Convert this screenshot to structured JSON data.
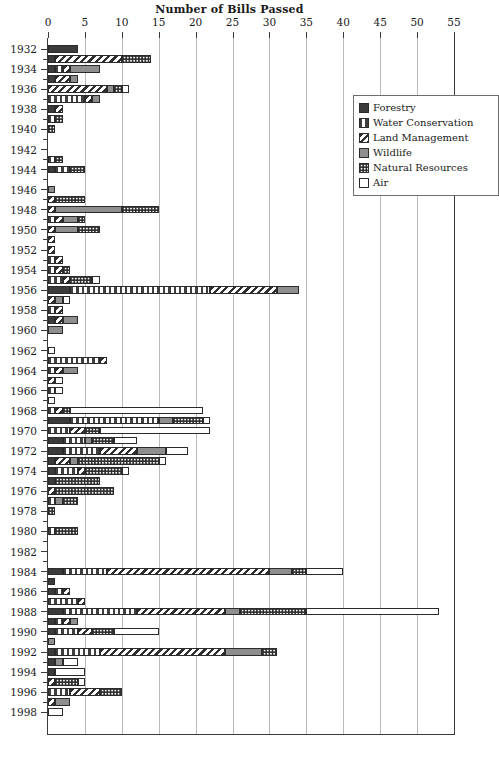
{
  "chart_data": {
    "type": "bar",
    "orientation": "horizontal",
    "stacked": true,
    "title": "Number of Bills Passed",
    "xlabel": "",
    "ylabel": "",
    "xlim": [
      0,
      55
    ],
    "xticks": [
      0,
      5,
      10,
      15,
      20,
      25,
      30,
      35,
      40,
      45,
      50,
      55
    ],
    "grid": "vertical",
    "legend_position": "top-right",
    "legend": [
      {
        "name": "Forestry",
        "pattern": "solid-dark",
        "color": "#3b3b3b"
      },
      {
        "name": "Water Conservation",
        "pattern": "vertical-stripes",
        "color": "#3f3f3f"
      },
      {
        "name": "Land Management",
        "pattern": "diagonal-stripes",
        "color": "#2f2f2f"
      },
      {
        "name": "Wildlife",
        "pattern": "solid-gray",
        "color": "#8e8e8e"
      },
      {
        "name": "Natural Resources",
        "pattern": "checkered",
        "color": "#2e2e2e"
      },
      {
        "name": "Air",
        "pattern": "empty-white",
        "color": "#ffffff"
      }
    ],
    "series": [
      "Forestry",
      "Water Conservation",
      "Land Management",
      "Wildlife",
      "Natural Resources",
      "Air"
    ],
    "ytick_labels": [
      1932,
      1934,
      1936,
      1938,
      1940,
      1942,
      1944,
      1946,
      1948,
      1950,
      1952,
      1954,
      1956,
      1958,
      1960,
      1962,
      1964,
      1966,
      1968,
      1970,
      1972,
      1974,
      1976,
      1978,
      1980,
      1982,
      1984,
      1986,
      1988,
      1990,
      1992,
      1994,
      1996,
      1998
    ],
    "rows": [
      {
        "year": 1932,
        "values": {
          "Forestry": 4,
          "Water Conservation": 0,
          "Land Management": 0,
          "Wildlife": 0,
          "Natural Resources": 0,
          "Air": 0
        },
        "total": 4
      },
      {
        "year": 1933,
        "values": {
          "Forestry": 1,
          "Water Conservation": 0,
          "Land Management": 9,
          "Wildlife": 0,
          "Natural Resources": 4,
          "Air": 0
        },
        "total": 14
      },
      {
        "year": 1934,
        "values": {
          "Forestry": 1,
          "Water Conservation": 1,
          "Land Management": 1,
          "Wildlife": 4,
          "Natural Resources": 0,
          "Air": 0
        },
        "total": 7
      },
      {
        "year": 1935,
        "values": {
          "Forestry": 1,
          "Water Conservation": 0,
          "Land Management": 2,
          "Wildlife": 1,
          "Natural Resources": 0,
          "Air": 0
        },
        "total": 4
      },
      {
        "year": 1936,
        "values": {
          "Forestry": 0,
          "Water Conservation": 0,
          "Land Management": 8,
          "Wildlife": 1,
          "Natural Resources": 1,
          "Air": 1
        },
        "total": 11
      },
      {
        "year": 1937,
        "values": {
          "Forestry": 0,
          "Water Conservation": 5,
          "Land Management": 1,
          "Wildlife": 1,
          "Natural Resources": 0,
          "Air": 0
        },
        "total": 7
      },
      {
        "year": 1938,
        "values": {
          "Forestry": 1,
          "Water Conservation": 0,
          "Land Management": 1,
          "Wildlife": 0,
          "Natural Resources": 0,
          "Air": 0
        },
        "total": 2
      },
      {
        "year": 1939,
        "values": {
          "Forestry": 0,
          "Water Conservation": 1,
          "Land Management": 0,
          "Wildlife": 0,
          "Natural Resources": 1,
          "Air": 0
        },
        "total": 2
      },
      {
        "year": 1940,
        "values": {
          "Forestry": 0,
          "Water Conservation": 0,
          "Land Management": 0,
          "Wildlife": 0,
          "Natural Resources": 1,
          "Air": 0
        },
        "total": 1
      },
      {
        "year": 1941,
        "values": {
          "Forestry": 0,
          "Water Conservation": 0,
          "Land Management": 0,
          "Wildlife": 0,
          "Natural Resources": 0,
          "Air": 0
        },
        "total": 0
      },
      {
        "year": 1942,
        "values": {
          "Forestry": 0,
          "Water Conservation": 0,
          "Land Management": 0,
          "Wildlife": 0,
          "Natural Resources": 0,
          "Air": 0
        },
        "total": 0
      },
      {
        "year": 1943,
        "values": {
          "Forestry": 0,
          "Water Conservation": 1,
          "Land Management": 0,
          "Wildlife": 0,
          "Natural Resources": 1,
          "Air": 0
        },
        "total": 2
      },
      {
        "year": 1944,
        "values": {
          "Forestry": 1,
          "Water Conservation": 2,
          "Land Management": 0,
          "Wildlife": 0,
          "Natural Resources": 2,
          "Air": 0
        },
        "total": 5
      },
      {
        "year": 1945,
        "values": {
          "Forestry": 0,
          "Water Conservation": 0,
          "Land Management": 0,
          "Wildlife": 0,
          "Natural Resources": 0,
          "Air": 0
        },
        "total": 0
      },
      {
        "year": 1946,
        "values": {
          "Forestry": 0,
          "Water Conservation": 0,
          "Land Management": 0,
          "Wildlife": 1,
          "Natural Resources": 0,
          "Air": 0
        },
        "total": 1
      },
      {
        "year": 1947,
        "values": {
          "Forestry": 0,
          "Water Conservation": 0,
          "Land Management": 1,
          "Wildlife": 0,
          "Natural Resources": 4,
          "Air": 0
        },
        "total": 5
      },
      {
        "year": 1948,
        "values": {
          "Forestry": 0,
          "Water Conservation": 0,
          "Land Management": 1,
          "Wildlife": 9,
          "Natural Resources": 5,
          "Air": 0
        },
        "total": 15
      },
      {
        "year": 1949,
        "values": {
          "Forestry": 0,
          "Water Conservation": 1,
          "Land Management": 1,
          "Wildlife": 2,
          "Natural Resources": 1,
          "Air": 0
        },
        "total": 5
      },
      {
        "year": 1950,
        "values": {
          "Forestry": 0,
          "Water Conservation": 0,
          "Land Management": 1,
          "Wildlife": 3,
          "Natural Resources": 3,
          "Air": 0
        },
        "total": 7
      },
      {
        "year": 1951,
        "values": {
          "Forestry": 0,
          "Water Conservation": 0,
          "Land Management": 1,
          "Wildlife": 0,
          "Natural Resources": 0,
          "Air": 0
        },
        "total": 1
      },
      {
        "year": 1952,
        "values": {
          "Forestry": 0,
          "Water Conservation": 0,
          "Land Management": 1,
          "Wildlife": 0,
          "Natural Resources": 0,
          "Air": 0
        },
        "total": 1
      },
      {
        "year": 1953,
        "values": {
          "Forestry": 0,
          "Water Conservation": 1,
          "Land Management": 1,
          "Wildlife": 0,
          "Natural Resources": 0,
          "Air": 0
        },
        "total": 2
      },
      {
        "year": 1954,
        "values": {
          "Forestry": 0,
          "Water Conservation": 1,
          "Land Management": 1,
          "Wildlife": 0,
          "Natural Resources": 1,
          "Air": 0
        },
        "total": 3
      },
      {
        "year": 1955,
        "values": {
          "Forestry": 0,
          "Water Conservation": 2,
          "Land Management": 1,
          "Wildlife": 0,
          "Natural Resources": 3,
          "Air": 1
        },
        "total": 7
      },
      {
        "year": 1956,
        "values": {
          "Forestry": 3,
          "Water Conservation": 19,
          "Land Management": 9,
          "Wildlife": 3,
          "Natural Resources": 0,
          "Air": 0
        },
        "total": 34
      },
      {
        "year": 1957,
        "values": {
          "Forestry": 0,
          "Water Conservation": 0,
          "Land Management": 1,
          "Wildlife": 1,
          "Natural Resources": 0,
          "Air": 1
        },
        "total": 3
      },
      {
        "year": 1958,
        "values": {
          "Forestry": 0,
          "Water Conservation": 1,
          "Land Management": 1,
          "Wildlife": 0,
          "Natural Resources": 0,
          "Air": 0
        },
        "total": 2
      },
      {
        "year": 1959,
        "values": {
          "Forestry": 1,
          "Water Conservation": 0,
          "Land Management": 1,
          "Wildlife": 2,
          "Natural Resources": 0,
          "Air": 0
        },
        "total": 4
      },
      {
        "year": 1960,
        "values": {
          "Forestry": 0,
          "Water Conservation": 0,
          "Land Management": 0,
          "Wildlife": 2,
          "Natural Resources": 0,
          "Air": 0
        },
        "total": 2
      },
      {
        "year": 1961,
        "values": {
          "Forestry": 0,
          "Water Conservation": 0,
          "Land Management": 0,
          "Wildlife": 0,
          "Natural Resources": 0,
          "Air": 0
        },
        "total": 0
      },
      {
        "year": 1962,
        "values": {
          "Forestry": 0,
          "Water Conservation": 0,
          "Land Management": 0,
          "Wildlife": 0,
          "Natural Resources": 0,
          "Air": 1
        },
        "total": 1
      },
      {
        "year": 1963,
        "values": {
          "Forestry": 0,
          "Water Conservation": 7,
          "Land Management": 1,
          "Wildlife": 0,
          "Natural Resources": 0,
          "Air": 0
        },
        "total": 8
      },
      {
        "year": 1964,
        "values": {
          "Forestry": 0,
          "Water Conservation": 1,
          "Land Management": 1,
          "Wildlife": 2,
          "Natural Resources": 0,
          "Air": 0
        },
        "total": 4
      },
      {
        "year": 1965,
        "values": {
          "Forestry": 0,
          "Water Conservation": 0,
          "Land Management": 1,
          "Wildlife": 0,
          "Natural Resources": 0,
          "Air": 1
        },
        "total": 2
      },
      {
        "year": 1966,
        "values": {
          "Forestry": 0,
          "Water Conservation": 1,
          "Land Management": 0,
          "Wildlife": 0,
          "Natural Resources": 0,
          "Air": 1
        },
        "total": 2
      },
      {
        "year": 1967,
        "values": {
          "Forestry": 0,
          "Water Conservation": 0,
          "Land Management": 0,
          "Wildlife": 0,
          "Natural Resources": 0,
          "Air": 1
        },
        "total": 1
      },
      {
        "year": 1968,
        "values": {
          "Forestry": 0,
          "Water Conservation": 1,
          "Land Management": 1,
          "Wildlife": 0,
          "Natural Resources": 1,
          "Air": 18
        },
        "total": 21
      },
      {
        "year": 1969,
        "values": {
          "Forestry": 3,
          "Water Conservation": 12,
          "Land Management": 0,
          "Wildlife": 2,
          "Natural Resources": 4,
          "Air": 1
        },
        "total": 22
      },
      {
        "year": 1970,
        "values": {
          "Forestry": 0,
          "Water Conservation": 3,
          "Land Management": 2,
          "Wildlife": 0,
          "Natural Resources": 2,
          "Air": 15
        },
        "total": 22
      },
      {
        "year": 1971,
        "values": {
          "Forestry": 2,
          "Water Conservation": 3,
          "Land Management": 0,
          "Wildlife": 1,
          "Natural Resources": 3,
          "Air": 3
        },
        "total": 12
      },
      {
        "year": 1972,
        "values": {
          "Forestry": 2,
          "Water Conservation": 5,
          "Land Management": 5,
          "Wildlife": 4,
          "Natural Resources": 0,
          "Air": 3
        },
        "total": 19
      },
      {
        "year": 1973,
        "values": {
          "Forestry": 1,
          "Water Conservation": 0,
          "Land Management": 2,
          "Wildlife": 1,
          "Natural Resources": 11,
          "Air": 1
        },
        "total": 16
      },
      {
        "year": 1974,
        "values": {
          "Forestry": 1,
          "Water Conservation": 3,
          "Land Management": 1,
          "Wildlife": 0,
          "Natural Resources": 5,
          "Air": 1
        },
        "total": 11
      },
      {
        "year": 1975,
        "values": {
          "Forestry": 1,
          "Water Conservation": 0,
          "Land Management": 0,
          "Wildlife": 0,
          "Natural Resources": 6,
          "Air": 0
        },
        "total": 7
      },
      {
        "year": 1976,
        "values": {
          "Forestry": 0,
          "Water Conservation": 0,
          "Land Management": 1,
          "Wildlife": 0,
          "Natural Resources": 8,
          "Air": 0
        },
        "total": 9
      },
      {
        "year": 1977,
        "values": {
          "Forestry": 0,
          "Water Conservation": 1,
          "Land Management": 0,
          "Wildlife": 1,
          "Natural Resources": 2,
          "Air": 0
        },
        "total": 4
      },
      {
        "year": 1978,
        "values": {
          "Forestry": 0,
          "Water Conservation": 0,
          "Land Management": 0,
          "Wildlife": 0,
          "Natural Resources": 1,
          "Air": 0
        },
        "total": 1
      },
      {
        "year": 1979,
        "values": {
          "Forestry": 0,
          "Water Conservation": 0,
          "Land Management": 0,
          "Wildlife": 0,
          "Natural Resources": 0,
          "Air": 0
        },
        "total": 0
      },
      {
        "year": 1980,
        "values": {
          "Forestry": 0,
          "Water Conservation": 1,
          "Land Management": 0,
          "Wildlife": 0,
          "Natural Resources": 3,
          "Air": 0
        },
        "total": 4
      },
      {
        "year": 1981,
        "values": {
          "Forestry": 0,
          "Water Conservation": 0,
          "Land Management": 0,
          "Wildlife": 0,
          "Natural Resources": 0,
          "Air": 0
        },
        "total": 0
      },
      {
        "year": 1982,
        "values": {
          "Forestry": 0,
          "Water Conservation": 0,
          "Land Management": 0,
          "Wildlife": 0,
          "Natural Resources": 0,
          "Air": 0
        },
        "total": 0
      },
      {
        "year": 1983,
        "values": {
          "Forestry": 0,
          "Water Conservation": 0,
          "Land Management": 0,
          "Wildlife": 0,
          "Natural Resources": 0,
          "Air": 0
        },
        "total": 0
      },
      {
        "year": 1984,
        "values": {
          "Forestry": 2,
          "Water Conservation": 6,
          "Land Management": 22,
          "Wildlife": 3,
          "Natural Resources": 2,
          "Air": 5
        },
        "total": 40
      },
      {
        "year": 1985,
        "values": {
          "Forestry": 1,
          "Water Conservation": 0,
          "Land Management": 0,
          "Wildlife": 0,
          "Natural Resources": 0,
          "Air": 0
        },
        "total": 1
      },
      {
        "year": 1986,
        "values": {
          "Forestry": 1,
          "Water Conservation": 1,
          "Land Management": 1,
          "Wildlife": 0,
          "Natural Resources": 0,
          "Air": 0
        },
        "total": 3
      },
      {
        "year": 1987,
        "values": {
          "Forestry": 0,
          "Water Conservation": 4,
          "Land Management": 1,
          "Wildlife": 0,
          "Natural Resources": 0,
          "Air": 0
        },
        "total": 5
      },
      {
        "year": 1988,
        "values": {
          "Forestry": 2,
          "Water Conservation": 10,
          "Land Management": 12,
          "Wildlife": 2,
          "Natural Resources": 9,
          "Air": 18
        },
        "total": 53
      },
      {
        "year": 1989,
        "values": {
          "Forestry": 1,
          "Water Conservation": 1,
          "Land Management": 1,
          "Wildlife": 1,
          "Natural Resources": 0,
          "Air": 0
        },
        "total": 4
      },
      {
        "year": 1990,
        "values": {
          "Forestry": 1,
          "Water Conservation": 3,
          "Land Management": 2,
          "Wildlife": 0,
          "Natural Resources": 3,
          "Air": 6
        },
        "total": 15
      },
      {
        "year": 1991,
        "values": {
          "Forestry": 0,
          "Water Conservation": 0,
          "Land Management": 0,
          "Wildlife": 1,
          "Natural Resources": 0,
          "Air": 0
        },
        "total": 1
      },
      {
        "year": 1992,
        "values": {
          "Forestry": 1,
          "Water Conservation": 6,
          "Land Management": 17,
          "Wildlife": 5,
          "Natural Resources": 2,
          "Air": 0
        },
        "total": 31
      },
      {
        "year": 1993,
        "values": {
          "Forestry": 1,
          "Water Conservation": 0,
          "Land Management": 0,
          "Wildlife": 1,
          "Natural Resources": 0,
          "Air": 2
        },
        "total": 4
      },
      {
        "year": 1994,
        "values": {
          "Forestry": 1,
          "Water Conservation": 0,
          "Land Management": 0,
          "Wildlife": 0,
          "Natural Resources": 0,
          "Air": 4
        },
        "total": 5
      },
      {
        "year": 1995,
        "values": {
          "Forestry": 0,
          "Water Conservation": 0,
          "Land Management": 1,
          "Wildlife": 0,
          "Natural Resources": 3,
          "Air": 1
        },
        "total": 5
      },
      {
        "year": 1996,
        "values": {
          "Forestry": 0,
          "Water Conservation": 3,
          "Land Management": 4,
          "Wildlife": 0,
          "Natural Resources": 3,
          "Air": 0
        },
        "total": 10
      },
      {
        "year": 1997,
        "values": {
          "Forestry": 0,
          "Water Conservation": 0,
          "Land Management": 1,
          "Wildlife": 2,
          "Natural Resources": 0,
          "Air": 0
        },
        "total": 3
      },
      {
        "year": 1998,
        "values": {
          "Forestry": 0,
          "Water Conservation": 0,
          "Land Management": 0,
          "Wildlife": 0,
          "Natural Resources": 0,
          "Air": 2
        },
        "total": 2
      }
    ]
  }
}
